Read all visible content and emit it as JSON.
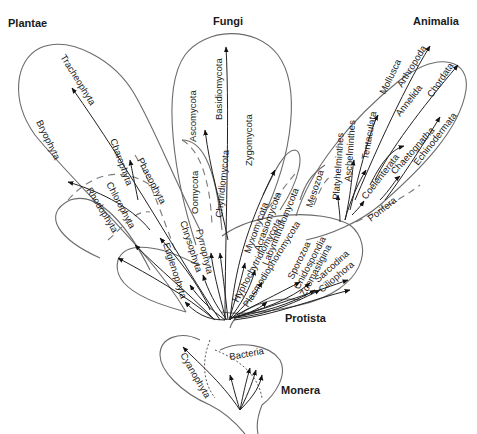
{
  "kingdoms": {
    "plantae": "Plantae",
    "fungi": "Fungi",
    "animalia": "Animalia",
    "protista": "Protista",
    "monera": "Monera"
  },
  "plantae_taxa": {
    "tracheophyta": "Tracheophyta",
    "bryophyta": "Bryophyta",
    "charophyta": "Charophyta",
    "chlorophyta": "Chlorophyta",
    "rhodophyta": "Rhodophyta",
    "phaeophyta": "Phaeophyta"
  },
  "fungi_taxa": {
    "ascomycota": "Ascomycota",
    "basidiomycota": "Basidiomycota",
    "zygomycota": "Zygomycota",
    "oomycota": "Oomycota",
    "chytridiomycota": "Chytridiomycota"
  },
  "protista_taxa": {
    "euglenophyta": "Euglenophyta",
    "chrysophyta": "Chrysophyta",
    "pyrrophyta": "Pyrrophyta",
    "myxomycota": "Myxomycota",
    "acrasiomycota": "Acrasiomycota",
    "labyrinthulomycota": "Labyrinthulomycota",
    "hyphochytridiomycota": "Hyphochytridiomycota",
    "plasmodiophoromycota": "Plasmodiophoromycota",
    "sporozoa": "Sporozoa",
    "cnidospondia": "Cnidospondia",
    "zoomastigina": "Zoomastigina",
    "sarcodina": "Sarcodina",
    "ciliophora": "Ciliophora"
  },
  "animalia_taxa": {
    "mesozoa": "Mesozoa",
    "platyhelminthes": "Platyhelminthes",
    "aschelminthes": "Aschelminthes",
    "tentaculata": "Tentaculata",
    "mollusca": "Mollusca",
    "arthropoda": "Arthropoda",
    "annelida": "Annelida",
    "chordata": "Chordata",
    "coelenterata": "Coelenterata",
    "chaetognatha": "Chaetognatha",
    "echinodermata": "Echinodermata",
    "porifera": "Porifera"
  },
  "monera_taxa": {
    "cyanophyta": "Cyanophyta",
    "bacteria": "Bacteria"
  }
}
